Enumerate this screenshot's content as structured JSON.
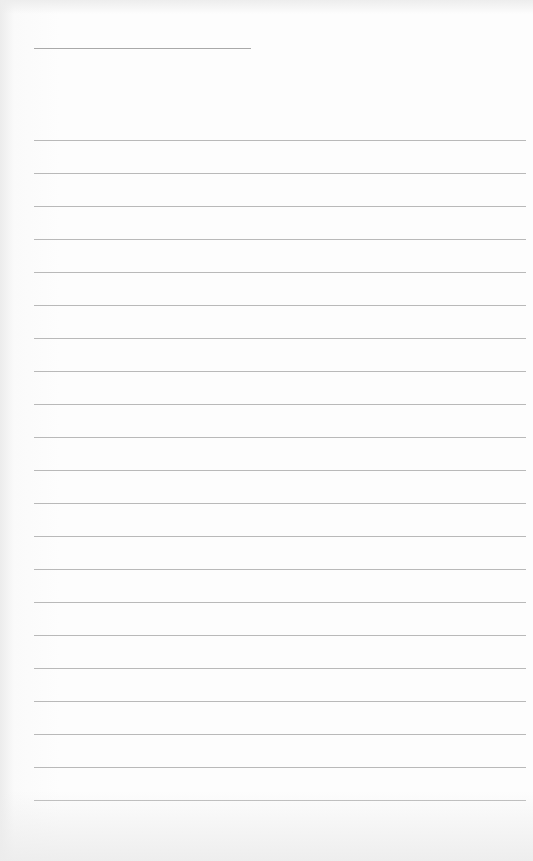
{
  "page": {
    "type": "lined-paper",
    "background_color": "#fdfdfd",
    "line_color": "#b9b9b9",
    "header_line": {
      "present": true
    },
    "ruled_lines": {
      "count": 21,
      "first_y": 140,
      "spacing": 33
    }
  }
}
